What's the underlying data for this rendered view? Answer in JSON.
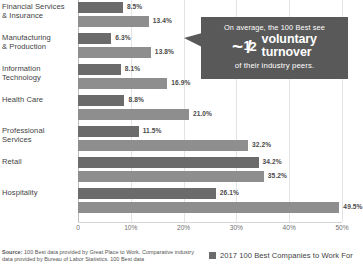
{
  "chart_data": {
    "type": "bar",
    "title": "",
    "xlabel": "",
    "ylabel": "",
    "orientation": "horizontal",
    "xlim": [
      0,
      50
    ],
    "grid": true,
    "legend_position": "bottom-right",
    "categories": [
      "Financial Services & Insurance",
      "Manufacturing & Production",
      "Information Technology",
      "Health Care",
      "Professional Services",
      "Retail",
      "Hospitality"
    ],
    "category_lines": [
      [
        "Financial Services",
        "& Insurance"
      ],
      [
        "Manufacturing",
        "& Production"
      ],
      [
        "Information",
        "Technology"
      ],
      [
        "Health Care",
        ""
      ],
      [
        "Professional",
        "Services"
      ],
      [
        "Retail",
        ""
      ],
      [
        "Hospitality",
        ""
      ]
    ],
    "series": [
      {
        "name": "2017 100 Best Companies to Work For",
        "color": "#6b6b6b",
        "values": [
          8.5,
          6.3,
          8.1,
          8.8,
          11.5,
          34.2,
          26.1
        ],
        "labels": [
          "8.5%",
          "6.3%",
          "8.1%",
          "8.8%",
          "11.5%",
          "34.2%",
          "26.1%"
        ]
      },
      {
        "name": "Industry average",
        "color": "#8e8e8e",
        "values": [
          13.4,
          13.8,
          16.9,
          21.0,
          32.2,
          35.2,
          49.5
        ],
        "labels": [
          "13.4%",
          "13.8%",
          "16.9%",
          "21.0%",
          "32.2%",
          "35.2%",
          "49.5%"
        ]
      }
    ],
    "xticks": [
      0,
      10,
      20,
      30,
      40,
      50
    ],
    "xtick_labels": [
      "0",
      "10%",
      "20%",
      "30%",
      "40%",
      "50%"
    ]
  },
  "callout": {
    "line1": "On average, the 100 Best see",
    "approx": "~",
    "numerator": "1",
    "slash": "/",
    "denominator": "2",
    "word1": "voluntary",
    "word2": "turnover",
    "line3": "of their industry peers.",
    "background": "#595959"
  },
  "footer": {
    "source_label": "Source:",
    "source_text": " 100 Best data provided by Great Place to Work. Comparative industry data provided by Bureau of Labor Statistics. 100 Best data",
    "legend_label": "2017 100 Best Companies to Work For",
    "legend_color": "#6b6b6b"
  }
}
